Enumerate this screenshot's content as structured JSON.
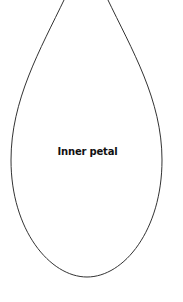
{
  "diagram": {
    "shape": "petal-outline",
    "label": "Inner petal",
    "stroke_color": "#333333",
    "fill_color": "#ffffff"
  }
}
